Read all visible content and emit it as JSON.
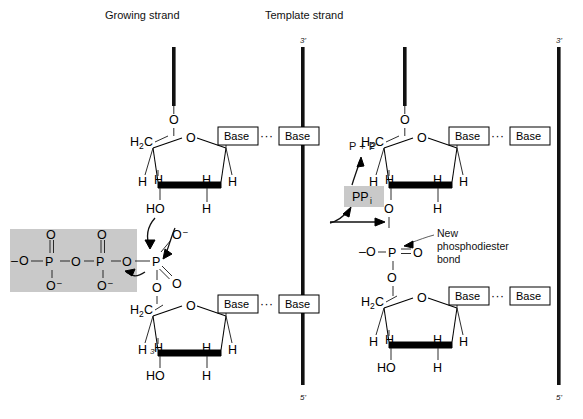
{
  "title_labels": {
    "growing_strand": "Growing  strand",
    "template_strand": "Template strand"
  },
  "strand_ends": {
    "left_template_top": "3'",
    "left_template_bottom": "5'",
    "right_template_top": "3'",
    "right_template_bottom": "5'",
    "left_sugar_3prime": "3'",
    "right_sugar_3prime": "3'"
  },
  "atoms": {
    "O": "O",
    "H": "H",
    "P": "P",
    "C": "C",
    "HO": "HO",
    "H2C_main": "H",
    "H2C_sub": "2",
    "H2C_tail": "C",
    "O_minus": "O",
    "minus": "–"
  },
  "base_pairs": {
    "label": "Base",
    "hbond": "···"
  },
  "reaction": {
    "pp_label": "P + P",
    "ppi_main": "PP",
    "ppi_sub": "i"
  },
  "annotation": {
    "line1": "New",
    "line2": "phosphodiester",
    "line3": "bond"
  },
  "colors": {
    "shade_gray": "#c9c9c9",
    "ink": "#111111",
    "paper": "#ffffff"
  }
}
